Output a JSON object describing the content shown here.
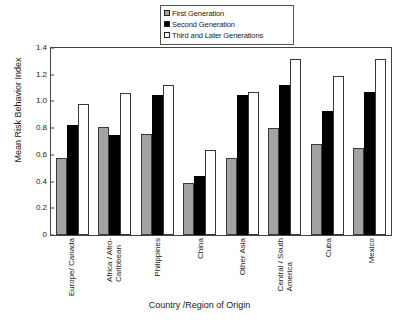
{
  "chart_data": {
    "type": "bar",
    "title": "",
    "xlabel": "Country /Region of Origin",
    "ylabel": "Mean Risk Behavior Index",
    "ylim": [
      0,
      1.4
    ],
    "ytick_labels": [
      "1.4",
      "1.2",
      "1.0",
      "0.8",
      "0.6",
      "0.4",
      "0.2",
      "0"
    ],
    "ytick_values": [
      1.4,
      1.2,
      1.0,
      0.8,
      0.6,
      0.4,
      0.2,
      0
    ],
    "grid": false,
    "legend_position": "top-center",
    "categories": [
      "Europe/ Canada",
      "Africa / Afro-Caribbean",
      "Philippines",
      "China",
      "Other Asia",
      "Central / South America",
      "Cuba",
      "Mexico"
    ],
    "category_lines": [
      [
        "Europe/ Canada"
      ],
      [
        "Africa / Afro-",
        "Caribbean"
      ],
      [
        "Philippines"
      ],
      [
        "China"
      ],
      [
        "Other Asia"
      ],
      [
        "Central / South",
        "America"
      ],
      [
        "Cuba"
      ],
      [
        "Mexico"
      ]
    ],
    "series": [
      {
        "name": "First Generation",
        "color": "#a3a3a3",
        "values": [
          0.58,
          0.81,
          0.76,
          0.39,
          0.58,
          0.8,
          0.68,
          0.65
        ]
      },
      {
        "name": "Second Generation",
        "color": "#000000",
        "values": [
          0.82,
          0.75,
          1.05,
          0.44,
          1.05,
          1.12,
          0.93,
          1.07
        ]
      },
      {
        "name": "Third and Later Generations",
        "color": "#ffffff",
        "values": [
          0.98,
          1.06,
          1.12,
          0.64,
          1.07,
          1.32,
          1.19,
          1.32
        ]
      }
    ]
  },
  "legend": {
    "items": [
      {
        "label": "First Generation"
      },
      {
        "label": "Second Generation"
      },
      {
        "label": "Third and Later Generations"
      }
    ]
  }
}
